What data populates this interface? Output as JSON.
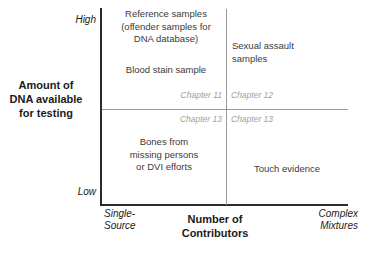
{
  "figure": {
    "name": "dna-quantity-vs-contributors-matrix"
  },
  "axes": {
    "y_title": "Amount of\nDNA available\nfor testing",
    "y_title_lines": [
      "Amount of",
      "DNA available",
      "for testing"
    ],
    "x_title_lines": [
      "Number of",
      "Contributors"
    ],
    "y_high_label": "High",
    "y_low_label": "Low",
    "x_left_label_lines": [
      "Single-",
      "Source"
    ],
    "x_right_label_lines": [
      "Complex",
      "Mixtures"
    ]
  },
  "quadrants": {
    "top_left_primary_lines": [
      "Reference samples",
      "(offender samples for",
      "DNA database)"
    ],
    "top_left_secondary": "Blood stain sample",
    "top_right": "Sexual assault\nsamples",
    "top_right_lines": [
      "Sexual assault",
      "samples"
    ],
    "bottom_left_lines": [
      "Bones from",
      "missing persons",
      "or DVI efforts"
    ],
    "bottom_right": "Touch evidence"
  },
  "chapter_refs": {
    "top_left": "Chapter 11",
    "top_right": "Chapter 12",
    "bottom_left": "Chapter 13",
    "bottom_right": "Chapter 13"
  },
  "colors": {
    "axis": "#2b2b2b",
    "divider": "#9a9a9a",
    "text": "#3a3a3a",
    "chapter_text": "#9e9e9e",
    "background": "#ffffff"
  },
  "chart_data": {
    "type": "scatter",
    "title": "",
    "xlabel": "Number of Contributors",
    "ylabel": "Amount of DNA available for testing",
    "x_categories": [
      "Single-Source",
      "Complex Mixtures"
    ],
    "y_categories": [
      "Low",
      "High"
    ],
    "grid": false,
    "legend": "none",
    "annotations": [
      {
        "label": "Reference samples (offender samples for DNA database)",
        "quadrant": "top-left",
        "x": "Single-Source",
        "y": "High",
        "chapter": "Chapter 11"
      },
      {
        "label": "Blood stain sample",
        "quadrant": "top-left",
        "x": "Single-Source",
        "y": "High",
        "chapter": "Chapter 11"
      },
      {
        "label": "Sexual assault samples",
        "quadrant": "top-right",
        "x": "Complex Mixtures",
        "y": "High",
        "chapter": "Chapter 12"
      },
      {
        "label": "Bones from missing persons or DVI efforts",
        "quadrant": "bottom-left",
        "x": "Single-Source",
        "y": "Low",
        "chapter": "Chapter 13"
      },
      {
        "label": "Touch evidence",
        "quadrant": "bottom-right",
        "x": "Complex Mixtures",
        "y": "Low",
        "chapter": "Chapter 13"
      }
    ]
  }
}
